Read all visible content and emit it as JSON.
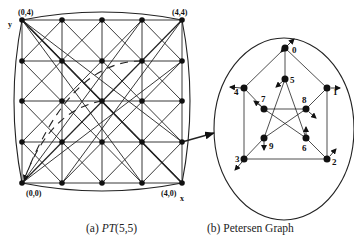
{
  "figure": {
    "left_panel": {
      "caption_prefix": "(a) ",
      "caption_name": "PT",
      "caption_args": "(5,5)",
      "axis_y_label": "y",
      "axis_x_label": "x",
      "corner_labels": {
        "top_left": "(0,4)",
        "top_right": "(4,4)",
        "bottom_left": "(0,0)",
        "bottom_right": "(4,0)"
      },
      "grid_size": 5
    },
    "right_panel": {
      "caption": "(b) Petersen Graph",
      "nodes": [
        {
          "id": "0",
          "label": "0"
        },
        {
          "id": "1",
          "label": "1"
        },
        {
          "id": "2",
          "label": "2"
        },
        {
          "id": "3",
          "label": "3"
        },
        {
          "id": "4",
          "label": "4"
        },
        {
          "id": "5",
          "label": "5"
        },
        {
          "id": "6",
          "label": "6"
        },
        {
          "id": "7",
          "label": "7"
        },
        {
          "id": "8",
          "label": "8"
        },
        {
          "id": "9",
          "label": "9"
        }
      ],
      "edges": [
        [
          "0",
          "1"
        ],
        [
          "1",
          "2"
        ],
        [
          "2",
          "3"
        ],
        [
          "3",
          "4"
        ],
        [
          "4",
          "0"
        ],
        [
          "0",
          "5"
        ],
        [
          "1",
          "8"
        ],
        [
          "2",
          "6"
        ],
        [
          "3",
          "9"
        ],
        [
          "4",
          "7"
        ],
        [
          "5",
          "9"
        ],
        [
          "5",
          "6"
        ],
        [
          "7",
          "8"
        ],
        [
          "7",
          "6"
        ],
        [
          "8",
          "9"
        ]
      ]
    },
    "colors": {
      "line": "#222222",
      "node": "#111111",
      "background": "#ffffff"
    }
  }
}
